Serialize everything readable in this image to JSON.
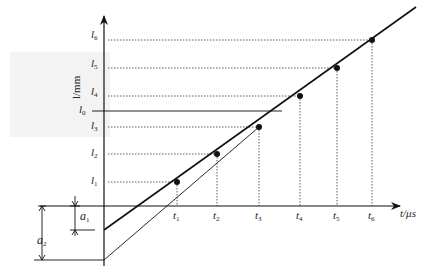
{
  "diagram": {
    "y_axis": {
      "label": "l/mm",
      "ticks": [
        {
          "id": "l6",
          "base": "l",
          "sub": "6",
          "y": 40
        },
        {
          "id": "l5",
          "base": "l",
          "sub": "5",
          "y": 68
        },
        {
          "id": "l4",
          "base": "l",
          "sub": "4",
          "y": 96
        },
        {
          "id": "l0",
          "base": "l",
          "sub": "0",
          "y": 111
        },
        {
          "id": "l3",
          "base": "l",
          "sub": "3",
          "y": 127
        },
        {
          "id": "l2",
          "base": "l",
          "sub": "2",
          "y": 154
        },
        {
          "id": "l1",
          "base": "l",
          "sub": "1",
          "y": 182
        }
      ]
    },
    "x_axis": {
      "label": "t/μs",
      "ticks": [
        {
          "id": "t1",
          "base": "t",
          "sub": "1",
          "x": 177
        },
        {
          "id": "t2",
          "base": "t",
          "sub": "2",
          "x": 217
        },
        {
          "id": "t3",
          "base": "t",
          "sub": "3",
          "x": 259
        },
        {
          "id": "t4",
          "base": "t",
          "sub": "4",
          "x": 300
        },
        {
          "id": "t5",
          "base": "t",
          "sub": "5",
          "x": 337
        },
        {
          "id": "t6",
          "base": "t",
          "sub": "6",
          "x": 372
        }
      ]
    },
    "points": [
      {
        "t": "t1",
        "l": "l1",
        "x": 177,
        "y": 182
      },
      {
        "t": "t2",
        "l": "l2",
        "x": 217,
        "y": 154
      },
      {
        "t": "t3",
        "l": "l3",
        "x": 259,
        "y": 127
      },
      {
        "t": "t4",
        "l": "l4",
        "x": 300,
        "y": 96
      },
      {
        "t": "t5",
        "l": "l5",
        "x": 337,
        "y": 68
      },
      {
        "t": "t6",
        "l": "l6",
        "x": 372,
        "y": 40
      }
    ],
    "intercepts": [
      {
        "id": "a1",
        "base": "a",
        "sub": "1"
      },
      {
        "id": "a2",
        "base": "a",
        "sub": "2"
      }
    ]
  }
}
